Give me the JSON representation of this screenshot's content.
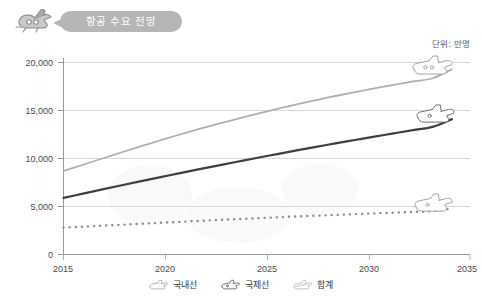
{
  "header": {
    "title": "항공 수요 전망",
    "badge_icon": "airplane-icon"
  },
  "unit": {
    "label": "단위: 만명"
  },
  "colors": {
    "total_line": "#b0b0b0",
    "international_line": "#3f3f3f",
    "domestic_line": "#8c8c8c",
    "axis": "#9a9a9a",
    "grid": "#d8d8d8",
    "pill_background": "#b6b6b6",
    "pill_text": "#ffffff",
    "tick_text": "#4a4a4a"
  },
  "legend": {
    "position": "bottom-center",
    "items": [
      {
        "label": "국내선",
        "icon": "airplane-icon",
        "style": "dotted",
        "color": "#8c8c8c"
      },
      {
        "label": "국제선",
        "icon": "airplane-icon",
        "style": "solid",
        "color": "#3f3f3f"
      },
      {
        "label": "합계",
        "icon": "airplane-icon",
        "style": "solid",
        "color": "#b0b0b0"
      }
    ]
  },
  "chart_data": {
    "type": "line",
    "title": "항공 수요 전망",
    "xlabel": "",
    "ylabel": "",
    "unit": "단위: 만명",
    "grid": true,
    "legend_position": "bottom-center",
    "xlim": [
      2015,
      2035
    ],
    "ylim": [
      0,
      20000
    ],
    "x_ticks": [
      "2015",
      "2020",
      "2025",
      "2030",
      "2035"
    ],
    "y_ticks": [
      "0",
      "5,000",
      "10,000",
      "15,000",
      "20,000"
    ],
    "y_tick_values": [
      0,
      5000,
      10000,
      15000,
      20000
    ],
    "x": [
      2015,
      2016,
      2017,
      2018,
      2019,
      2020,
      2021,
      2022,
      2023,
      2024,
      2025,
      2026,
      2027,
      2028,
      2029,
      2030,
      2031,
      2032,
      2033,
      2034,
      2035
    ],
    "series": [
      {
        "name": "합계",
        "style": "solid",
        "color": "#b0b0b0",
        "end_marker": "airplane-icon",
        "values": [
          8700,
          9350,
          10000,
          10650,
          11280,
          11900,
          12500,
          13080,
          13630,
          14160,
          14670,
          15160,
          15630,
          16080,
          16510,
          16920,
          17310,
          17680,
          18030,
          18360,
          19300
        ]
      },
      {
        "name": "국제선",
        "style": "solid",
        "color": "#3f3f3f",
        "end_marker": "airplane-icon",
        "values": [
          5900,
          6340,
          6780,
          7210,
          7640,
          8060,
          8480,
          8890,
          9290,
          9690,
          10080,
          10460,
          10840,
          11210,
          11570,
          11930,
          12280,
          12620,
          12960,
          13290,
          14100
        ]
      },
      {
        "name": "국내선",
        "style": "dotted",
        "color": "#8c8c8c",
        "end_marker": "airplane-icon",
        "values": [
          2800,
          2900,
          3000,
          3100,
          3200,
          3300,
          3400,
          3500,
          3600,
          3690,
          3780,
          3870,
          3960,
          4040,
          4120,
          4200,
          4280,
          4360,
          4440,
          4520,
          4800
        ]
      }
    ]
  }
}
